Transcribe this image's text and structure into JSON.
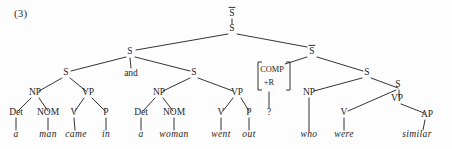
{
  "figure": {
    "example_number": "(3)",
    "ink_color": "#1d1d1d",
    "background_color": "#fdfdfd"
  },
  "tree_data": {
    "type": "syntax-tree",
    "description": "Phrase structure tree for coordinated sentence with relative clause",
    "sentence": "a man came in and a woman went out who were similar",
    "nodes": [
      {
        "id": "root",
        "label": "S",
        "overbar": true,
        "x": 232,
        "y": 16
      },
      {
        "id": "s-top",
        "label": "S",
        "overbar": false,
        "x": 232,
        "y": 31
      },
      {
        "id": "s-left",
        "label": "S",
        "overbar": false,
        "x": 130,
        "y": 54
      },
      {
        "id": "sbar-right",
        "label": "S",
        "overbar": true,
        "x": 312,
        "y": 54
      },
      {
        "id": "s-c1",
        "label": "S",
        "overbar": false,
        "x": 66,
        "y": 75
      },
      {
        "id": "conj",
        "label": "and",
        "overbar": false,
        "x": 131,
        "y": 76
      },
      {
        "id": "s-c2",
        "label": "S",
        "overbar": false,
        "x": 194,
        "y": 75
      },
      {
        "id": "comp",
        "label": "COMP",
        "overbar": false,
        "x": 272,
        "y": 72
      },
      {
        "id": "comp-r",
        "label": "+R",
        "overbar": false,
        "x": 269,
        "y": 85
      },
      {
        "id": "s-rel",
        "label": "S",
        "overbar": false,
        "x": 367,
        "y": 75
      },
      {
        "id": "np1",
        "label": "NP",
        "overbar": false,
        "x": 35,
        "y": 95
      },
      {
        "id": "vp1",
        "label": "VP",
        "overbar": false,
        "x": 88,
        "y": 95
      },
      {
        "id": "np2",
        "label": "NP",
        "overbar": false,
        "x": 159,
        "y": 95
      },
      {
        "id": "vp2",
        "label": "VP",
        "overbar": false,
        "x": 237,
        "y": 95
      },
      {
        "id": "np-rel",
        "label": "NP",
        "overbar": false,
        "x": 309,
        "y": 95
      },
      {
        "id": "vp-rel",
        "label": "VP",
        "overbar": false,
        "x": 397,
        "y": 101
      },
      {
        "id": "det1",
        "label": "Det",
        "overbar": false,
        "x": 16,
        "y": 115
      },
      {
        "id": "nom1",
        "label": "NOM",
        "overbar": false,
        "x": 48,
        "y": 115
      },
      {
        "id": "v1",
        "label": "V",
        "overbar": false,
        "x": 74,
        "y": 115
      },
      {
        "id": "p1",
        "label": "P",
        "overbar": false,
        "x": 106,
        "y": 115
      },
      {
        "id": "det2",
        "label": "Det",
        "overbar": false,
        "x": 141,
        "y": 115
      },
      {
        "id": "nom2",
        "label": "NOM",
        "overbar": false,
        "x": 174,
        "y": 115
      },
      {
        "id": "v2",
        "label": "V",
        "overbar": false,
        "x": 221,
        "y": 115
      },
      {
        "id": "p2",
        "label": "P",
        "overbar": false,
        "x": 249,
        "y": 115
      },
      {
        "id": "qmark",
        "label": "?",
        "overbar": false,
        "x": 269,
        "y": 115
      },
      {
        "id": "v-rel",
        "label": "V",
        "overbar": false,
        "x": 344,
        "y": 115
      },
      {
        "id": "ap",
        "label": "AP",
        "overbar": false,
        "x": 427,
        "y": 117
      }
    ],
    "terminals": [
      {
        "id": "w-a1",
        "label": "a",
        "parent": "det1",
        "x": 16,
        "y": 137
      },
      {
        "id": "w-man",
        "label": "man",
        "parent": "nom1",
        "x": 48,
        "y": 137
      },
      {
        "id": "w-came",
        "label": "came",
        "parent": "v1",
        "x": 76,
        "y": 137
      },
      {
        "id": "w-in",
        "label": "in",
        "parent": "p1",
        "x": 106,
        "y": 137
      },
      {
        "id": "w-a2",
        "label": "a",
        "parent": "det2",
        "x": 141,
        "y": 137
      },
      {
        "id": "w-woman",
        "label": "woman",
        "parent": "nom2",
        "x": 174,
        "y": 137
      },
      {
        "id": "w-went",
        "label": "went",
        "parent": "v2",
        "x": 221,
        "y": 137
      },
      {
        "id": "w-out",
        "label": "out",
        "parent": "p2",
        "x": 249,
        "y": 137
      },
      {
        "id": "w-who",
        "label": "who",
        "parent": "np-rel",
        "x": 309,
        "y": 137
      },
      {
        "id": "w-were",
        "label": "were",
        "parent": "v-rel",
        "x": 344,
        "y": 137
      },
      {
        "id": "w-similar",
        "label": "similar",
        "parent": "ap",
        "x": 417,
        "y": 137
      }
    ],
    "edges": [
      {
        "from": "root",
        "to": "s-top",
        "x1": 232,
        "y1": 19,
        "x2": 232,
        "y2": 24
      },
      {
        "from": "s-top",
        "to": "s-left",
        "x1": 228,
        "y1": 34,
        "x2": 136,
        "y2": 50
      },
      {
        "from": "s-top",
        "to": "sbar-right",
        "x1": 237,
        "y1": 34,
        "x2": 307,
        "y2": 47
      },
      {
        "from": "s-left",
        "to": "s-c1",
        "x1": 126,
        "y1": 57,
        "x2": 71,
        "y2": 71
      },
      {
        "from": "s-left",
        "to": "conj",
        "x1": 130,
        "y1": 58,
        "x2": 131,
        "y2": 68
      },
      {
        "from": "s-left",
        "to": "s-c2",
        "x1": 135,
        "y1": 57,
        "x2": 190,
        "y2": 71
      },
      {
        "from": "sbar-right",
        "to": "comp",
        "x1": 307,
        "y1": 57,
        "x2": 285,
        "y2": 64
      },
      {
        "from": "sbar-right",
        "to": "s-rel",
        "x1": 317,
        "y1": 57,
        "x2": 363,
        "y2": 71
      },
      {
        "from": "comp",
        "to": "qmark",
        "x1": 269,
        "y1": 92,
        "x2": 269,
        "y2": 108
      },
      {
        "from": "s-c1",
        "to": "np1",
        "x1": 62,
        "y1": 78,
        "x2": 39,
        "y2": 91
      },
      {
        "from": "s-c1",
        "to": "vp1",
        "x1": 70,
        "y1": 78,
        "x2": 86,
        "y2": 91
      },
      {
        "from": "s-c2",
        "to": "np2",
        "x1": 190,
        "y1": 78,
        "x2": 163,
        "y2": 91
      },
      {
        "from": "s-c2",
        "to": "vp2",
        "x1": 198,
        "y1": 78,
        "x2": 233,
        "y2": 91
      },
      {
        "from": "s-rel",
        "to": "np-rel",
        "x1": 362,
        "y1": 78,
        "x2": 314,
        "y2": 91
      },
      {
        "from": "s-rel",
        "to": "s-inner",
        "x1": 371,
        "y1": 78,
        "x2": 398,
        "y2": 88
      },
      {
        "from": "s-inner",
        "to": "v-rel",
        "x1": 396,
        "y1": 90,
        "x2": 348,
        "y2": 111
      },
      {
        "from": "s-inner",
        "to": "vp-rel",
        "x1": 399,
        "y1": 90,
        "x2": 399,
        "y2": 97
      },
      {
        "from": "vp-rel",
        "to": "ap",
        "x1": 401,
        "y1": 104,
        "x2": 424,
        "y2": 113
      },
      {
        "from": "np1",
        "to": "det1",
        "x1": 31,
        "y1": 98,
        "x2": 18,
        "y2": 111
      },
      {
        "from": "np1",
        "to": "nom1",
        "x1": 39,
        "y1": 98,
        "x2": 48,
        "y2": 111
      },
      {
        "from": "vp1",
        "to": "v1",
        "x1": 84,
        "y1": 98,
        "x2": 75,
        "y2": 111
      },
      {
        "from": "vp1",
        "to": "p1",
        "x1": 92,
        "y1": 98,
        "x2": 105,
        "y2": 111
      },
      {
        "from": "np2",
        "to": "det2",
        "x1": 155,
        "y1": 98,
        "x2": 143,
        "y2": 111
      },
      {
        "from": "np2",
        "to": "nom2",
        "x1": 163,
        "y1": 98,
        "x2": 173,
        "y2": 111
      },
      {
        "from": "vp2",
        "to": "v2",
        "x1": 233,
        "y1": 98,
        "x2": 223,
        "y2": 111
      },
      {
        "from": "vp2",
        "to": "p2",
        "x1": 241,
        "y1": 98,
        "x2": 249,
        "y2": 111
      },
      {
        "from": "det1",
        "to": "w-a1",
        "x1": 16,
        "y1": 118,
        "x2": 16,
        "y2": 130
      },
      {
        "from": "nom1",
        "to": "w-man",
        "x1": 48,
        "y1": 118,
        "x2": 48,
        "y2": 130
      },
      {
        "from": "v1",
        "to": "w-came",
        "x1": 74,
        "y1": 118,
        "x2": 75,
        "y2": 130
      },
      {
        "from": "p1",
        "to": "w-in",
        "x1": 106,
        "y1": 118,
        "x2": 106,
        "y2": 130
      },
      {
        "from": "det2",
        "to": "w-a2",
        "x1": 141,
        "y1": 118,
        "x2": 141,
        "y2": 130
      },
      {
        "from": "nom2",
        "to": "w-woman",
        "x1": 174,
        "y1": 118,
        "x2": 174,
        "y2": 130
      },
      {
        "from": "v2",
        "to": "w-went",
        "x1": 221,
        "y1": 118,
        "x2": 221,
        "y2": 130
      },
      {
        "from": "p2",
        "to": "w-out",
        "x1": 249,
        "y1": 118,
        "x2": 249,
        "y2": 130
      },
      {
        "from": "np-rel",
        "to": "w-who",
        "x1": 309,
        "y1": 98,
        "x2": 309,
        "y2": 130
      },
      {
        "from": "v-rel",
        "to": "w-were",
        "x1": 344,
        "y1": 118,
        "x2": 344,
        "y2": 130
      },
      {
        "from": "ap",
        "to": "w-similar",
        "x1": 425,
        "y1": 120,
        "x2": 423,
        "y2": 130
      }
    ],
    "inner_s_node": {
      "id": "s-inner",
      "label": "S",
      "overbar": false,
      "x": 398,
      "y": 87
    },
    "comp_bracket": {
      "left_x": 258,
      "right_x": 290,
      "top_y": 62,
      "bottom_y": 90,
      "tick": 4
    }
  }
}
